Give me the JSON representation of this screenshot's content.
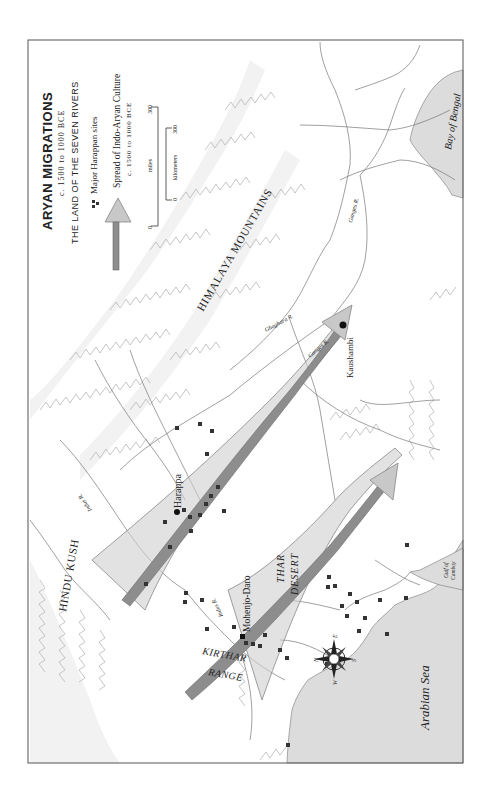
{
  "legend": {
    "title": "ARYAN MIGRATIONS",
    "subtitle": "c. 1500 to 1000 BCE",
    "subtitle2": "THE LAND OF THE SEVEN RIVERS",
    "sites_label": "Major Harappan sites",
    "spread_label": "Spread of Indo-Aryan Culture",
    "spread_date": "c. 1500 to 1000 BCE",
    "scale": {
      "miles_label": "miles",
      "miles_0": "0",
      "miles_300": "300",
      "km_label": "kilometers",
      "km_0": "0",
      "km_300": "300"
    }
  },
  "labels": {
    "himalaya": "HIMALAYA MOUNTAINS",
    "hindu_kush": "HINDU KUSH",
    "thar": "THAR",
    "desert": "DESERT",
    "kirthar": "KIRTHAR",
    "range": "RANGE",
    "harappa": "Harappa",
    "mohenjo_daro": "Mohenjo-Daro",
    "kaushambi": "Kaushambi",
    "ganges_upper": "Ganges R.",
    "ganges_lower": "Ganges R.",
    "ghaghara": "Ghaghara R.",
    "indus_upper": "Indus R.",
    "indus_lower": "Indus R.",
    "bay_of_bengal": "Bay of Bengal",
    "arabian_sea": "Arabian Sea",
    "gulf_of": "Gulf of",
    "cambay": "Cambay"
  },
  "compass": {
    "n": "N",
    "e": "E",
    "s": "S",
    "w": "W"
  },
  "colors": {
    "sea": "#dcdcdc",
    "fan": "#cfcfcf",
    "shaft": "#8d8d8d",
    "frame": "#555555"
  }
}
